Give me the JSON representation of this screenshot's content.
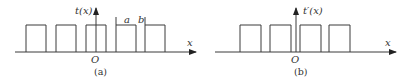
{
  "panels": [
    {
      "id": "a",
      "caption": "(a)",
      "ylabel": "t(x)",
      "xlabel": "x",
      "origin": "O",
      "dim_a": "a",
      "dim_b": "b",
      "pulses_x": [
        [
          26,
          46
        ],
        [
          56,
          76
        ],
        [
          86,
          106
        ],
        [
          116,
          136
        ],
        [
          145,
          165
        ]
      ]
    },
    {
      "id": "b",
      "caption": "(b)",
      "ylabel": "t′(x)",
      "xlabel": "x",
      "origin": "O",
      "pulses_x": [
        [
          240,
          261
        ],
        [
          270,
          291
        ],
        [
          300,
          321
        ],
        [
          329,
          350
        ]
      ]
    }
  ],
  "colors": {
    "stroke": "#3a3a3a",
    "text": "#333333"
  }
}
